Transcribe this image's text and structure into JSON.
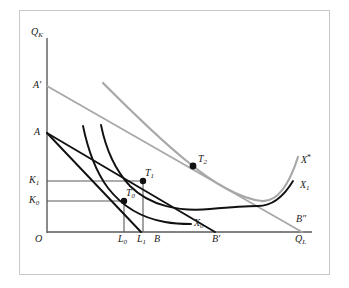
{
  "figure": {
    "kind": "isoquant-isocost-diagram",
    "background": "#ffffff",
    "frame_color": "#c9c9c9",
    "axis_color": "#5a5a5a",
    "black_color": "#111111",
    "gray_color": "#a8a8a8"
  },
  "axes": {
    "y_label": "Q",
    "y_label_sub": "K",
    "x_label": "Q",
    "x_label_sub": "L",
    "origin_label": "O"
  },
  "axis_marks": {
    "y": [
      {
        "id": "A-prime",
        "text": "A",
        "prime": "′"
      },
      {
        "id": "A",
        "text": "A",
        "prime": ""
      },
      {
        "id": "K1",
        "text": "K",
        "sub": "1"
      },
      {
        "id": "K0",
        "text": "K",
        "sub": "0"
      }
    ],
    "x": [
      {
        "id": "L0",
        "text": "L",
        "sub": "0"
      },
      {
        "id": "L1",
        "text": "L",
        "sub": "1"
      },
      {
        "id": "B",
        "text": "B",
        "prime": ""
      },
      {
        "id": "B-prime",
        "text": "B",
        "prime": "′"
      },
      {
        "id": "B-double-prime",
        "text": "B",
        "prime": "″"
      }
    ]
  },
  "curves": [
    {
      "id": "X0",
      "label": "X",
      "sub": "0",
      "style": "black",
      "role": "isoquant"
    },
    {
      "id": "X1",
      "label": "X",
      "sub": "1",
      "style": "black",
      "role": "isoquant"
    },
    {
      "id": "Xstar",
      "label": "X",
      "sup": "*",
      "style": "gray",
      "role": "expansion-isoquant"
    }
  ],
  "tangency_points": [
    {
      "id": "T0",
      "label": "T",
      "sub": "0",
      "x": 124,
      "y": 201,
      "style": "black"
    },
    {
      "id": "T1",
      "label": "T",
      "sub": "1",
      "x": 143,
      "y": 181,
      "style": "black"
    },
    {
      "id": "T2",
      "label": "T",
      "sub": "2",
      "x": 193,
      "y": 166,
      "style": "gray"
    }
  ],
  "isocost_lines": [
    {
      "id": "AB",
      "from": "A",
      "to": "B",
      "style": "black"
    },
    {
      "id": "AB-prime",
      "from": "A",
      "to": "B′",
      "style": "black"
    },
    {
      "id": "A-prime-B-double-prime",
      "from": "A′",
      "to": "B″",
      "style": "gray"
    }
  ],
  "guides": [
    {
      "id": "K0-guide",
      "from": "K0",
      "to": "L0"
    },
    {
      "id": "K1-guide",
      "from": "K1",
      "to": "L1"
    }
  ]
}
